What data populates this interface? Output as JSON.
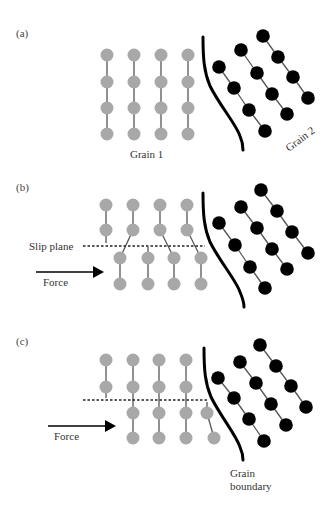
{
  "figure": {
    "colors": {
      "grain1_atom": "#a8a8a8",
      "grain2_atom": "#000000",
      "bond": "#555555",
      "boundary": "#000000",
      "text": "#333333"
    },
    "panels": [
      {
        "id": "a",
        "label": "(a)",
        "description": "Undeformed grains separated by a grain boundary",
        "grain1_label": "Grain 1",
        "grain2_label": "Grain 2"
      },
      {
        "id": "b",
        "label": "(b)",
        "description": "Slip along slip plane under applied force",
        "slip_plane_label": "Slip plane",
        "force_label": "Force"
      },
      {
        "id": "c",
        "label": "(c)",
        "description": "Dislocation pile-up at the grain boundary",
        "force_label": "Force",
        "boundary_label_line1": "Grain",
        "boundary_label_line2": "boundary"
      }
    ]
  }
}
